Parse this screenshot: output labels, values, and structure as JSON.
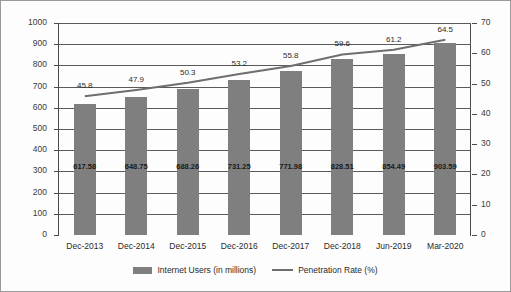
{
  "chart_data": {
    "type": "bar",
    "title": "",
    "subtitle": "",
    "xlabel": "",
    "ylabel": "",
    "categories": [
      "Dec-2013",
      "Dec-2014",
      "Dec-2015",
      "Dec-2016",
      "Dec-2017",
      "Dec-2018",
      "Jun-2019",
      "Mar-2020"
    ],
    "series": [
      {
        "name": "Internet Users (in millions)",
        "type": "bar",
        "axis": "left",
        "values": [
          617.58,
          648.75,
          688.26,
          731.25,
          771.98,
          828.51,
          854.49,
          903.59
        ],
        "color": "#7f7f7f"
      },
      {
        "name": "Penetration Rate (%)",
        "type": "line",
        "axis": "right",
        "values": [
          45.8,
          47.9,
          50.3,
          53.2,
          55.8,
          59.6,
          61.2,
          64.5
        ],
        "color": "#6e6e6e"
      }
    ],
    "y_left": {
      "min": 0,
      "max": 1000,
      "step": 100,
      "ticks": [
        "0",
        "100",
        "200",
        "300",
        "400",
        "500",
        "600",
        "700",
        "800",
        "900",
        "1000"
      ]
    },
    "y_right": {
      "min": 0,
      "max": 70,
      "step": 10,
      "ticks": [
        "0",
        "10",
        "20",
        "30",
        "40",
        "50",
        "60",
        "70"
      ]
    },
    "grid": true,
    "legend_position": "bottom"
  },
  "legend": {
    "items": [
      {
        "label": "Internet Users (in millions)",
        "marker": "bar-swatch"
      },
      {
        "label": "Penetration Rate (%)",
        "marker": "line-swatch"
      }
    ]
  }
}
